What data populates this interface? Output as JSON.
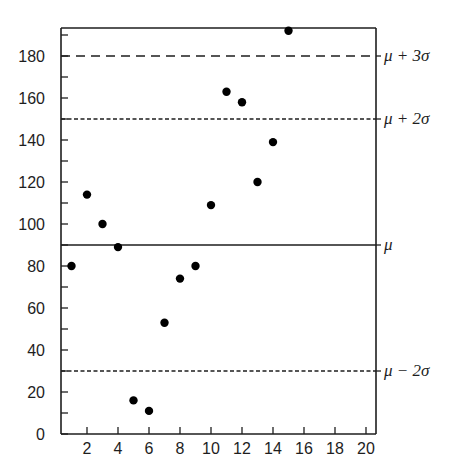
{
  "chart_data": {
    "type": "scatter",
    "title": "",
    "xlabel": "",
    "ylabel": "",
    "xlim": [
      0,
      20
    ],
    "ylim": [
      0,
      193
    ],
    "grid": false,
    "legend": null,
    "x_ticks": [
      2,
      4,
      6,
      8,
      10,
      12,
      14,
      16,
      18,
      20
    ],
    "y_ticks_labeled": [
      0,
      20,
      40,
      60,
      80,
      100,
      120,
      140,
      160,
      180
    ],
    "y_ticks_minor": [
      10,
      30,
      50,
      70,
      90,
      110,
      130,
      150,
      170,
      190
    ],
    "series": [
      {
        "name": "observations",
        "marker": "filled-circle",
        "color": "#000000",
        "x": [
          1,
          2,
          3,
          4,
          5,
          6,
          7,
          8,
          9,
          10,
          11,
          12,
          13,
          14,
          15
        ],
        "y": [
          80,
          114,
          100,
          89,
          16,
          11,
          53,
          74,
          80,
          109,
          163,
          158,
          120,
          139,
          192
        ]
      }
    ],
    "reference_lines": [
      {
        "label": "μ + 3σ",
        "y": 180,
        "style": "long-dash"
      },
      {
        "label": "μ + 2σ",
        "y": 150,
        "style": "short-dash"
      },
      {
        "label": "μ",
        "y": 90,
        "style": "solid"
      },
      {
        "label": "μ − 2σ",
        "y": 30,
        "style": "short-dash"
      }
    ]
  }
}
